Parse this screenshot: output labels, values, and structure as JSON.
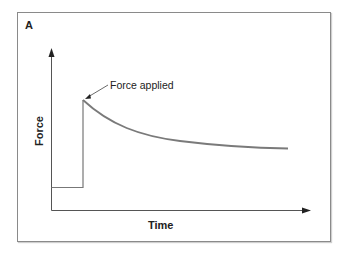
{
  "figure": {
    "panel_label": "A",
    "annotation": "Force applied",
    "x_axis_label": "Time",
    "y_axis_label": "Force",
    "colors": {
      "axes": "#444444",
      "curve": "#7a7a7a",
      "frame": "#8a8a8a"
    }
  }
}
